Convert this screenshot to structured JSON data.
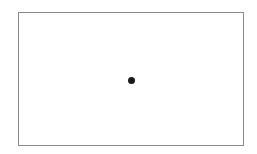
{
  "diagram": {
    "frame": {
      "stroke": "#8a8a8a",
      "fill": "#ffffff"
    },
    "points": [
      {
        "label": "",
        "x": 131,
        "y": 80,
        "color": "#1a1a1a"
      }
    ]
  }
}
